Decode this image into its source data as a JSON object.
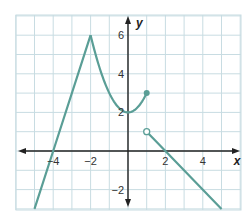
{
  "chart_data": {
    "type": "line",
    "title": "",
    "xlabel": "x",
    "ylabel": "y",
    "xlim": [
      -6,
      6
    ],
    "ylim": [
      -3,
      7
    ],
    "grid": true,
    "x_ticks": [
      -4,
      -2,
      2,
      4
    ],
    "y_ticks": [
      -2,
      2,
      4,
      6
    ],
    "x_tick_labels": [
      "−4",
      "−2",
      "2",
      "4"
    ],
    "y_tick_labels": [
      "−2",
      "2",
      "4",
      "6"
    ],
    "series": [
      {
        "name": "linear increasing piece",
        "kind": "line",
        "points": [
          [
            -5,
            -3
          ],
          [
            -4,
            0
          ],
          [
            -2,
            6
          ]
        ]
      },
      {
        "name": "parabolic piece",
        "kind": "curve",
        "points": [
          [
            -2,
            6
          ],
          [
            -1,
            3
          ],
          [
            0,
            2
          ],
          [
            1,
            3
          ]
        ],
        "end": {
          "x": 1,
          "y": 3,
          "marker": "closed"
        }
      },
      {
        "name": "linear decreasing piece",
        "kind": "line",
        "points": [
          [
            1,
            1
          ],
          [
            2,
            0
          ],
          [
            5,
            -3
          ]
        ],
        "start": {
          "x": 1,
          "y": 1,
          "marker": "open"
        }
      }
    ],
    "colors": {
      "curve": "#5a9e96",
      "grid": "#c8dce2",
      "axis": "#222222"
    }
  }
}
